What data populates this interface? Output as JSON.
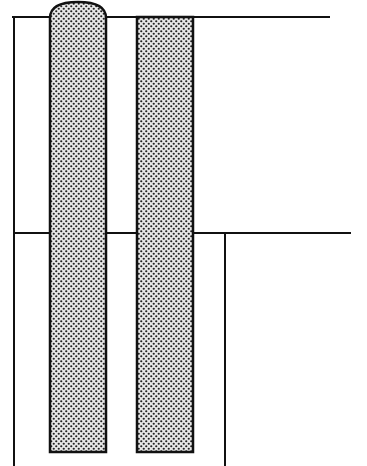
{
  "diagram": {
    "colors": {
      "line": "#111111",
      "fill_base": "#ffffff",
      "stipple_dot": "#222222",
      "background": "#ffffff"
    },
    "upper_level": {
      "y": 17,
      "x_start": 12,
      "x_end": 330
    },
    "lower_level": {
      "y": 233,
      "x_start": 15,
      "x_end": 351
    },
    "left_wall": {
      "x": 14,
      "y_top": 17,
      "y_bottom": 466
    },
    "right_wall": {
      "x": 225,
      "y_top": 233,
      "y_bottom": 466
    },
    "piles": [
      {
        "name": "left-pile",
        "x": 50,
        "width": 56,
        "y_top": 17,
        "y_bottom": 452,
        "rounded_cap": true
      },
      {
        "name": "right-pile",
        "x": 137,
        "width": 56,
        "y_top": 17,
        "y_bottom": 452,
        "rounded_cap": false
      }
    ]
  }
}
